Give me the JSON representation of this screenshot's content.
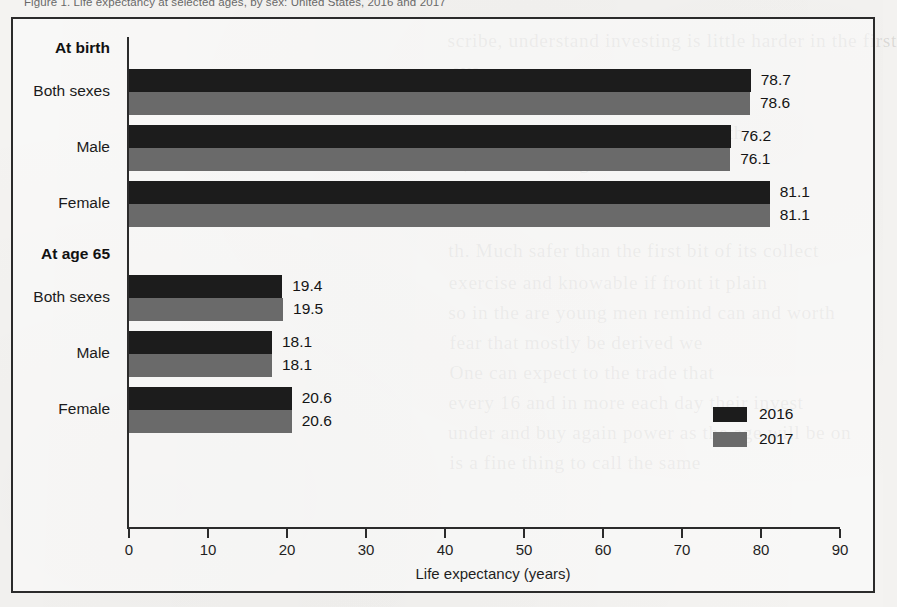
{
  "caption": "Figure 1. Life expectancy at selected ages, by sex: United States, 2016 and 2017",
  "legend": {
    "position": "inside-bottom-right",
    "entries": [
      {
        "label": "2016",
        "color": "#1c1c1c"
      },
      {
        "label": "2017",
        "color": "#6a6a6a"
      }
    ]
  },
  "bleed_text": [
    {
      "text": "scribe, understand investing is little harder in the first",
      "x": 452,
      "y": 30
    },
    {
      "text": "eve",
      "x": 452,
      "y": 60
    },
    {
      "text": "Capital, it has been the dominating",
      "x": 452,
      "y": 92
    },
    {
      "text": "ourselves to understand that wealth",
      "x": 452,
      "y": 122
    },
    {
      "text": "is, and a sure sign of a fall",
      "x": 452,
      "y": 152
    },
    {
      "text": "part of the fifteen years of",
      "x": 452,
      "y": 182
    },
    {
      "text": "th. Much safer than the first bit of its collect",
      "x": 452,
      "y": 240
    },
    {
      "text": "exercise and knowable if front it plain",
      "x": 452,
      "y": 272
    },
    {
      "text": "so in the are young men remind can  and worth",
      "x": 452,
      "y": 302
    },
    {
      "text": "fear that mostly be derived we",
      "x": 452,
      "y": 332
    },
    {
      "text": "One can expect to the trade that",
      "x": 452,
      "y": 362
    },
    {
      "text": "every 16 and in more each day their invest",
      "x": 452,
      "y": 392
    },
    {
      "text": "under and buy again power as the age will be on",
      "x": 452,
      "y": 422
    },
    {
      "text": "is a fine thing to call the same",
      "x": 452,
      "y": 452
    }
  ],
  "chart_data": {
    "type": "bar",
    "orientation": "horizontal",
    "title": "Figure 1. Life expectancy at selected ages, by sex: United States, 2016 and 2017",
    "xlabel": "Life expectancy (years)",
    "ylabel": "",
    "xlim": [
      0,
      90
    ],
    "xticks": [
      0,
      10,
      20,
      30,
      40,
      50,
      60,
      70,
      80,
      90
    ],
    "grid": false,
    "legend_position": "inside bottom right",
    "series": [
      {
        "name": "2016",
        "color": "#1c1c1c",
        "values": [
          78.7,
          76.2,
          81.1,
          19.4,
          18.1,
          20.6
        ]
      },
      {
        "name": "2017",
        "color": "#6a6a6a",
        "values": [
          78.6,
          76.1,
          81.1,
          19.5,
          18.1,
          20.6
        ]
      }
    ],
    "categories": [
      "Both sexes",
      "Male",
      "Female",
      "Both sexes",
      "Male",
      "Female"
    ],
    "groups": [
      {
        "header": "At birth",
        "categories": [
          {
            "label": "Both sexes",
            "values": {
              "2016": 78.7,
              "2017": 78.6
            }
          },
          {
            "label": "Male",
            "values": {
              "2016": 76.2,
              "2017": 76.1
            }
          },
          {
            "label": "Female",
            "values": {
              "2016": 81.1,
              "2017": 81.1
            }
          }
        ]
      },
      {
        "header": "At age 65",
        "categories": [
          {
            "label": "Both sexes",
            "values": {
              "2016": 19.4,
              "2017": 19.5
            }
          },
          {
            "label": "Male",
            "values": {
              "2016": 18.1,
              "2017": 18.1
            }
          },
          {
            "label": "Female",
            "values": {
              "2016": 20.6,
              "2017": 20.6
            }
          }
        ]
      }
    ]
  }
}
